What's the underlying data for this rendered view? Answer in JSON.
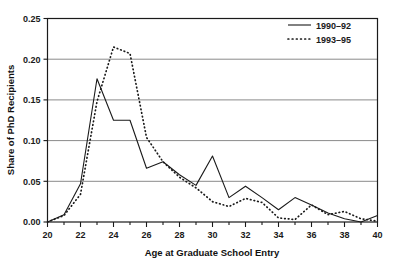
{
  "chart_data": {
    "type": "line",
    "title": "",
    "xlabel": "Age at Graduate School Entry",
    "ylabel": "Share of PhD Recipients",
    "xlim": [
      20,
      40
    ],
    "ylim": [
      0.0,
      0.25
    ],
    "grid": true,
    "legend_position": "top-right",
    "xticks": [
      "20",
      "22",
      "24",
      "26",
      "28",
      "30",
      "32",
      "34",
      "36",
      "38",
      "40"
    ],
    "xtick_values": [
      20,
      22,
      24,
      26,
      28,
      30,
      32,
      34,
      36,
      38,
      40
    ],
    "xtick_minor_values": [
      21,
      23,
      25,
      27,
      29,
      31,
      33,
      35,
      37,
      39
    ],
    "yticks": [
      "0.00",
      "0.05",
      "0.10",
      "0.15",
      "0.20",
      "0.25"
    ],
    "ytick_values": [
      0.0,
      0.05,
      0.1,
      0.15,
      0.2,
      0.25
    ],
    "x": [
      20,
      21,
      22,
      23,
      24,
      25,
      26,
      27,
      28,
      29,
      30,
      31,
      32,
      33,
      34,
      35,
      36,
      37,
      38,
      39,
      40
    ],
    "series": [
      {
        "name": "1990–92",
        "style": "solid",
        "values": [
          0.0,
          0.009,
          0.047,
          0.176,
          0.125,
          0.125,
          0.066,
          0.074,
          0.058,
          0.045,
          0.081,
          0.03,
          0.044,
          0.03,
          0.015,
          0.03,
          0.021,
          0.011,
          0.004,
          0.0,
          0.008
        ]
      },
      {
        "name": "1993–95",
        "style": "dotted",
        "values": [
          0.0,
          0.008,
          0.034,
          0.148,
          0.215,
          0.207,
          0.104,
          0.074,
          0.055,
          0.042,
          0.025,
          0.019,
          0.029,
          0.024,
          0.005,
          0.003,
          0.021,
          0.009,
          0.013,
          0.004,
          0.001
        ]
      }
    ]
  },
  "legend": {
    "entries": [
      {
        "label": "1990–92",
        "style": "solid"
      },
      {
        "label": "1993–95",
        "style": "dotted"
      }
    ]
  },
  "colors": {
    "ink": "#1a1a1a",
    "grid": "#8a8a8a",
    "background": "#ffffff"
  }
}
